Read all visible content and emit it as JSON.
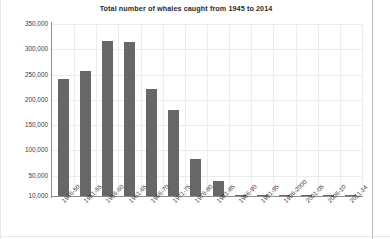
{
  "chart_data": {
    "type": "bar",
    "title": "Total number of whales caught from 1945 to 2014",
    "xlabel": "",
    "ylabel": "",
    "grid": true,
    "legend": "none",
    "ylim": [
      10000,
      350000
    ],
    "ytick_labels": [
      "350,000",
      "300,000",
      "250,000",
      "200,000",
      "150,000",
      "100,000",
      "50,000",
      "10,000"
    ],
    "ytick_values": [
      350000,
      300000,
      250000,
      200000,
      150000,
      100000,
      50000,
      10000
    ],
    "categories": [
      "1946-50",
      "1951-55",
      "1956-60",
      "1961-65",
      "1966-70",
      "1971-75",
      "1976-80",
      "1981-85",
      "1986-90",
      "1991-95",
      "1996-2000",
      "2001-05",
      "2006-10",
      "2011-14"
    ],
    "values": [
      241000,
      258000,
      317000,
      315000,
      221000,
      181000,
      83000,
      40000,
      12000,
      4000,
      8000,
      9000,
      9000,
      6000
    ],
    "bar_color": "#676767",
    "grid_color": "#ececed",
    "axis_color": "#8e8e8e",
    "background_color": "#ffffff"
  }
}
